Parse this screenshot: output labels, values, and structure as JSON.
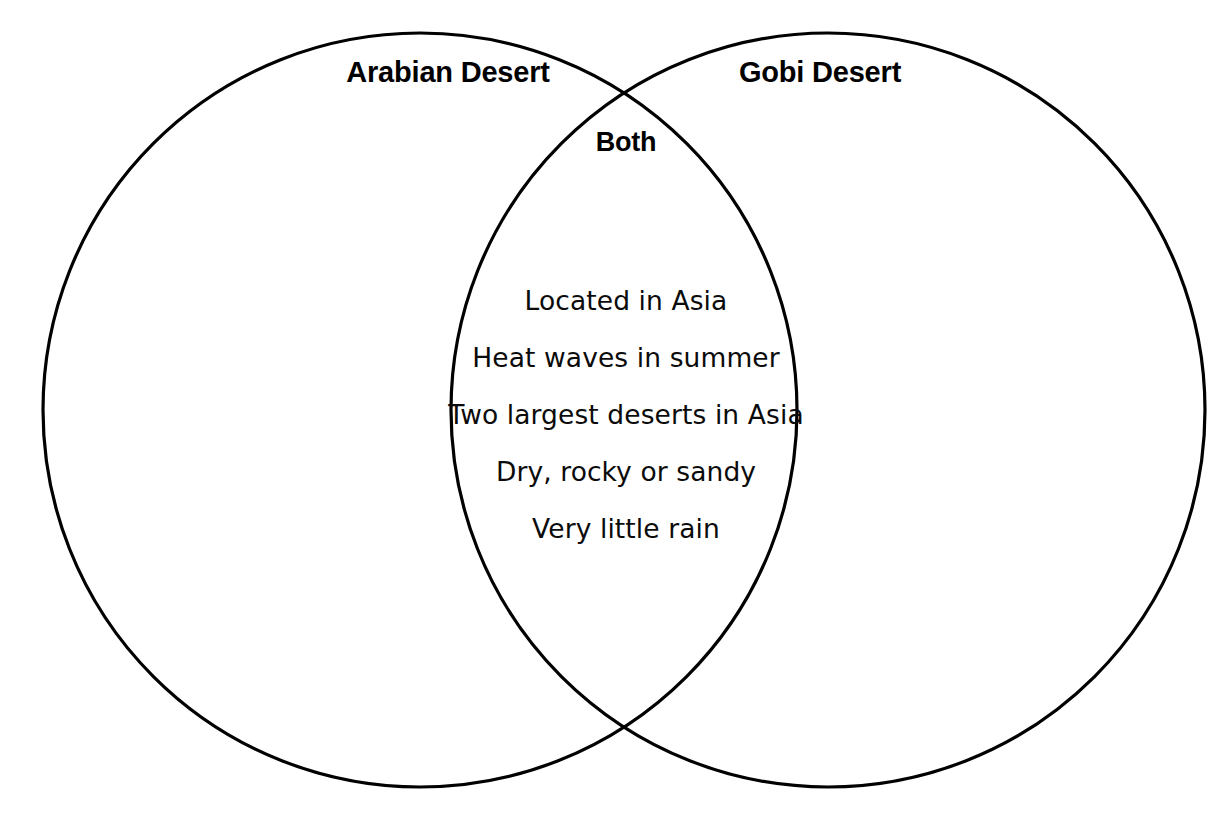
{
  "diagram": {
    "type": "venn-diagram",
    "title_visible": false,
    "background_color": "#ffffff",
    "stroke_color": "#000000",
    "text_color": "#000000",
    "left_set": {
      "label": "Arabian Desert",
      "items": []
    },
    "right_set": {
      "label": "Gobi Desert",
      "items": []
    },
    "intersection": {
      "label": "Both",
      "items": [
        "Located in Asia",
        "Heat waves in summer",
        "Two largest deserts in Asia",
        "Dry, rocky or sandy",
        "Very little rain"
      ]
    }
  }
}
